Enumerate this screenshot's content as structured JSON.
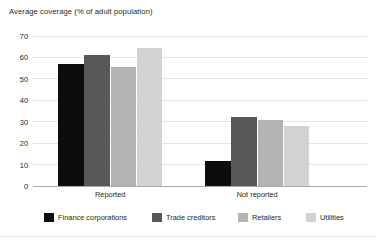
{
  "chart_data": {
    "type": "bar",
    "title": "Average coverage (% of adult population)",
    "xlabel": "",
    "ylabel": "",
    "ylim": [
      0,
      70
    ],
    "yticks": [
      0,
      10,
      20,
      30,
      40,
      50,
      60,
      70
    ],
    "grid": true,
    "legend_position": "bottom",
    "categories": [
      "Reported",
      "Not reported"
    ],
    "series": [
      {
        "name": "Finance corporations",
        "color": "#0d0d0d",
        "values": [
          57,
          11.5
        ]
      },
      {
        "name": "Trade creditors",
        "color": "#58585a",
        "values": [
          61,
          32
        ]
      },
      {
        "name": "Retailers",
        "color": "#b3b3b3",
        "values": [
          55.5,
          31
        ]
      },
      {
        "name": "Utilities",
        "color": "#d2d2d2",
        "values": [
          64.5,
          28
        ]
      }
    ]
  },
  "colors": {
    "grid": "#e4e3e3",
    "axis": "#a9a9a9",
    "text": "#231f20",
    "background": "#ffffff"
  }
}
